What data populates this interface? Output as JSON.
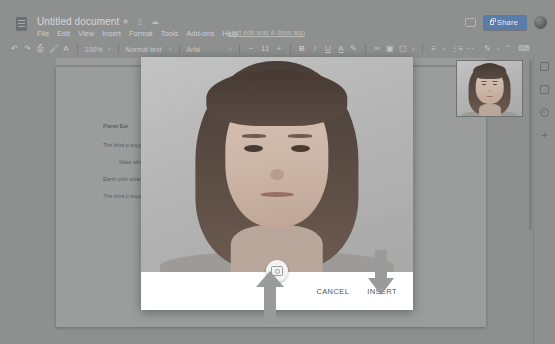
{
  "app": {
    "name": "Google Docs",
    "document_title": "Untitled document"
  },
  "titlebar": {
    "doc_icon": "document-icon",
    "star_icon": "★",
    "move_icon": "▯",
    "cloud_icon": "☁",
    "last_edit": "Last edit was 4 days ago",
    "comment_icon": "comment-icon",
    "share_label": "Share",
    "avatar": "user-avatar"
  },
  "menubar": {
    "items": [
      {
        "label": "File"
      },
      {
        "label": "Edit"
      },
      {
        "label": "View"
      },
      {
        "label": "Insert"
      },
      {
        "label": "Format"
      },
      {
        "label": "Tools"
      },
      {
        "label": "Add-ons"
      },
      {
        "label": "Help"
      }
    ]
  },
  "toolbar": {
    "undo_icon": "↶",
    "redo_icon": "↷",
    "print_icon": "⎙",
    "paint_format_icon": "🖌",
    "spelling_icon": "A",
    "zoom_value": "100%",
    "style_value": "Normal text",
    "font_value": "Arial",
    "font_size_decrease": "−",
    "font_size_value": "11",
    "font_size_increase": "+",
    "bold_label": "B",
    "italic_label": "I",
    "underline_label": "U",
    "text_color_label": "A",
    "highlight_icon": "✎",
    "link_icon": "∞",
    "comment_icon": "▣",
    "image_icon": "▢",
    "align_icon": "≡",
    "list_icon": "⋮≡",
    "more_icon": "⋯",
    "edit_mode_icon": "✎",
    "collapse_icon": "⌃",
    "keyboard_icon": "⌨",
    "caret": "▾"
  },
  "document": {
    "paragraphs": [
      {
        "style": "head",
        "text": "Planet Ear"
      },
      {
        "style": "body",
        "text": "The third p support life Solar Syst"
      },
      {
        "style": "indent",
        "text": "Wate other ga"
      },
      {
        "style": "body",
        "text": "Earth orbit solar days"
      },
      {
        "style": "body",
        "text": "The third p support the Solar Syst"
      }
    ]
  },
  "siderail": {
    "items": [
      {
        "icon": "calendar-icon",
        "glyph": ""
      },
      {
        "icon": "keep-notes-icon",
        "glyph": ""
      },
      {
        "icon": "tasks-icon",
        "glyph": ""
      },
      {
        "icon": "add-ons-plus-icon",
        "glyph": "+"
      }
    ]
  },
  "preview": {
    "name": "webcam-preview-thumbnail"
  },
  "dialog": {
    "name": "camera-capture-dialog",
    "video_feed": "webcam-live-video",
    "capture_button": "capture-photo-button",
    "cancel_label": "CANCEL",
    "insert_label": "INSERT"
  },
  "annotations": {
    "arrow_up": "arrow-pointing-to-capture-button",
    "arrow_down": "arrow-pointing-to-insert-button",
    "arrow_color": "#9a9b9b"
  },
  "colors": {
    "chrome_overlay": "#8e8f8f",
    "share_blue": "#5a7ca8",
    "dialog_background": "#ffffff",
    "page_background": "#9b9c9c"
  }
}
